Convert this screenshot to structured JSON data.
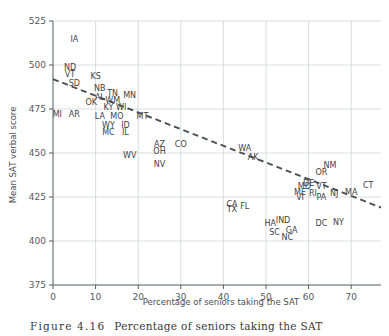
{
  "figure": {
    "caption_number": "Figure 4.16",
    "caption_text": "Percentage of seniors taking the SAT"
  },
  "chart_data": {
    "type": "scatter",
    "title": "",
    "xlabel": "Percentage of seniors taking the SAT",
    "ylabel": "Mean SAT verbal score",
    "xlim": [
      0,
      77
    ],
    "ylim": [
      375,
      525
    ],
    "xticks": [
      0,
      10,
      20,
      30,
      40,
      50,
      60,
      70
    ],
    "yticks": [
      375,
      400,
      425,
      450,
      475,
      500,
      525
    ],
    "grid": true,
    "legend": "none",
    "point_marker": "text-label",
    "trendline": {
      "type": "linear-dashed",
      "x_start": 0,
      "y_start": 492,
      "x_end": 77,
      "y_end": 419
    },
    "points": [
      {
        "label": "IA",
        "x": 5,
        "y": 515
      },
      {
        "label": "ND",
        "x": 4,
        "y": 499
      },
      {
        "label": "VT",
        "x": 4,
        "y": 495
      },
      {
        "label": "KS",
        "x": 10,
        "y": 494
      },
      {
        "label": "SD",
        "x": 5,
        "y": 490
      },
      {
        "label": "NB",
        "x": 11,
        "y": 487
      },
      {
        "label": "TN",
        "x": 14,
        "y": 484
      },
      {
        "label": "MN",
        "x": 18,
        "y": 483
      },
      {
        "label": "AL",
        "x": 11,
        "y": 482
      },
      {
        "label": "WM",
        "x": 14,
        "y": 480
      },
      {
        "label": "OK",
        "x": 9,
        "y": 479
      },
      {
        "label": "KY",
        "x": 13,
        "y": 476
      },
      {
        "label": "WI",
        "x": 16,
        "y": 476
      },
      {
        "label": "MI",
        "x": 1,
        "y": 472
      },
      {
        "label": "AR",
        "x": 5,
        "y": 472
      },
      {
        "label": "LA",
        "x": 11,
        "y": 471
      },
      {
        "label": "MO",
        "x": 15,
        "y": 471
      },
      {
        "label": "MT",
        "x": 21,
        "y": 471
      },
      {
        "label": "WY",
        "x": 13,
        "y": 466
      },
      {
        "label": "ID",
        "x": 17,
        "y": 466
      },
      {
        "label": "MC",
        "x": 13,
        "y": 462
      },
      {
        "label": "IL",
        "x": 17,
        "y": 462
      },
      {
        "label": "AZ",
        "x": 25,
        "y": 455
      },
      {
        "label": "CO",
        "x": 30,
        "y": 455
      },
      {
        "label": "WA",
        "x": 45,
        "y": 453
      },
      {
        "label": "OH",
        "x": 25,
        "y": 451
      },
      {
        "label": "WV",
        "x": 18,
        "y": 449
      },
      {
        "label": "AK",
        "x": 47,
        "y": 448
      },
      {
        "label": "NV",
        "x": 25,
        "y": 444
      },
      {
        "label": "NM",
        "x": 65,
        "y": 443
      },
      {
        "label": "OR",
        "x": 63,
        "y": 439
      },
      {
        "label": "DE",
        "x": 60,
        "y": 433
      },
      {
        "label": "CT",
        "x": 74,
        "y": 432
      },
      {
        "label": "MD",
        "x": 59,
        "y": 431
      },
      {
        "label": "VT",
        "x": 63,
        "y": 431
      },
      {
        "label": "ME",
        "x": 58,
        "y": 428
      },
      {
        "label": "MA",
        "x": 70,
        "y": 428
      },
      {
        "label": "RI",
        "x": 61,
        "y": 427
      },
      {
        "label": "NJ",
        "x": 66,
        "y": 427
      },
      {
        "label": "VI",
        "x": 58,
        "y": 425
      },
      {
        "label": "PA",
        "x": 63,
        "y": 425
      },
      {
        "label": "CA",
        "x": 42,
        "y": 421
      },
      {
        "label": "FL",
        "x": 45,
        "y": 420
      },
      {
        "label": "TX",
        "x": 42,
        "y": 418
      },
      {
        "label": "IND",
        "x": 54,
        "y": 412
      },
      {
        "label": "NY",
        "x": 67,
        "y": 411
      },
      {
        "label": "HA",
        "x": 51,
        "y": 410
      },
      {
        "label": "DC",
        "x": 63,
        "y": 410
      },
      {
        "label": "GA",
        "x": 56,
        "y": 406
      },
      {
        "label": "SC",
        "x": 52,
        "y": 405
      },
      {
        "label": "NC",
        "x": 55,
        "y": 402
      }
    ]
  }
}
